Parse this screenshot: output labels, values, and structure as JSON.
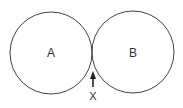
{
  "diagram": {
    "type": "tangent-circles",
    "circles": [
      {
        "label": "A",
        "cx": 51,
        "cy": 53,
        "r": 41
      },
      {
        "label": "B",
        "cx": 133,
        "cy": 52,
        "r": 41
      }
    ],
    "pointer": {
      "label": "X",
      "target": "tangent point between A and B"
    },
    "colors": {
      "stroke": "#444444",
      "text": "#333333",
      "background": "#ffffff"
    }
  }
}
